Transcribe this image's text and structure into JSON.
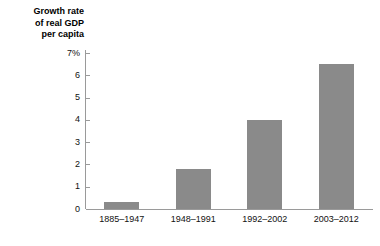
{
  "chart_data": {
    "type": "bar",
    "title": "Growth rate of real GDP per capita",
    "title_lines": [
      "Growth rate",
      "of real GDP",
      "per capita"
    ],
    "xlabel": "",
    "ylabel": "Growth rate of real GDP per capita",
    "categories": [
      "1885–1947",
      "1948–1991",
      "1992–2002",
      "2003–2012"
    ],
    "values": [
      0.3,
      1.8,
      4.0,
      6.5
    ],
    "ylim": [
      0,
      7
    ],
    "y_ticks": [
      0,
      1,
      2,
      3,
      4,
      5,
      6,
      7
    ],
    "y_tick_labels": [
      "0",
      "1",
      "2",
      "3",
      "4",
      "5",
      "6",
      "7%"
    ],
    "unit": "%",
    "grid": false,
    "legend": false,
    "bar_color": "#8a8a8a",
    "axis_color": "#9a9a9a",
    "text_color": "#111111",
    "background": "#ffffff"
  }
}
